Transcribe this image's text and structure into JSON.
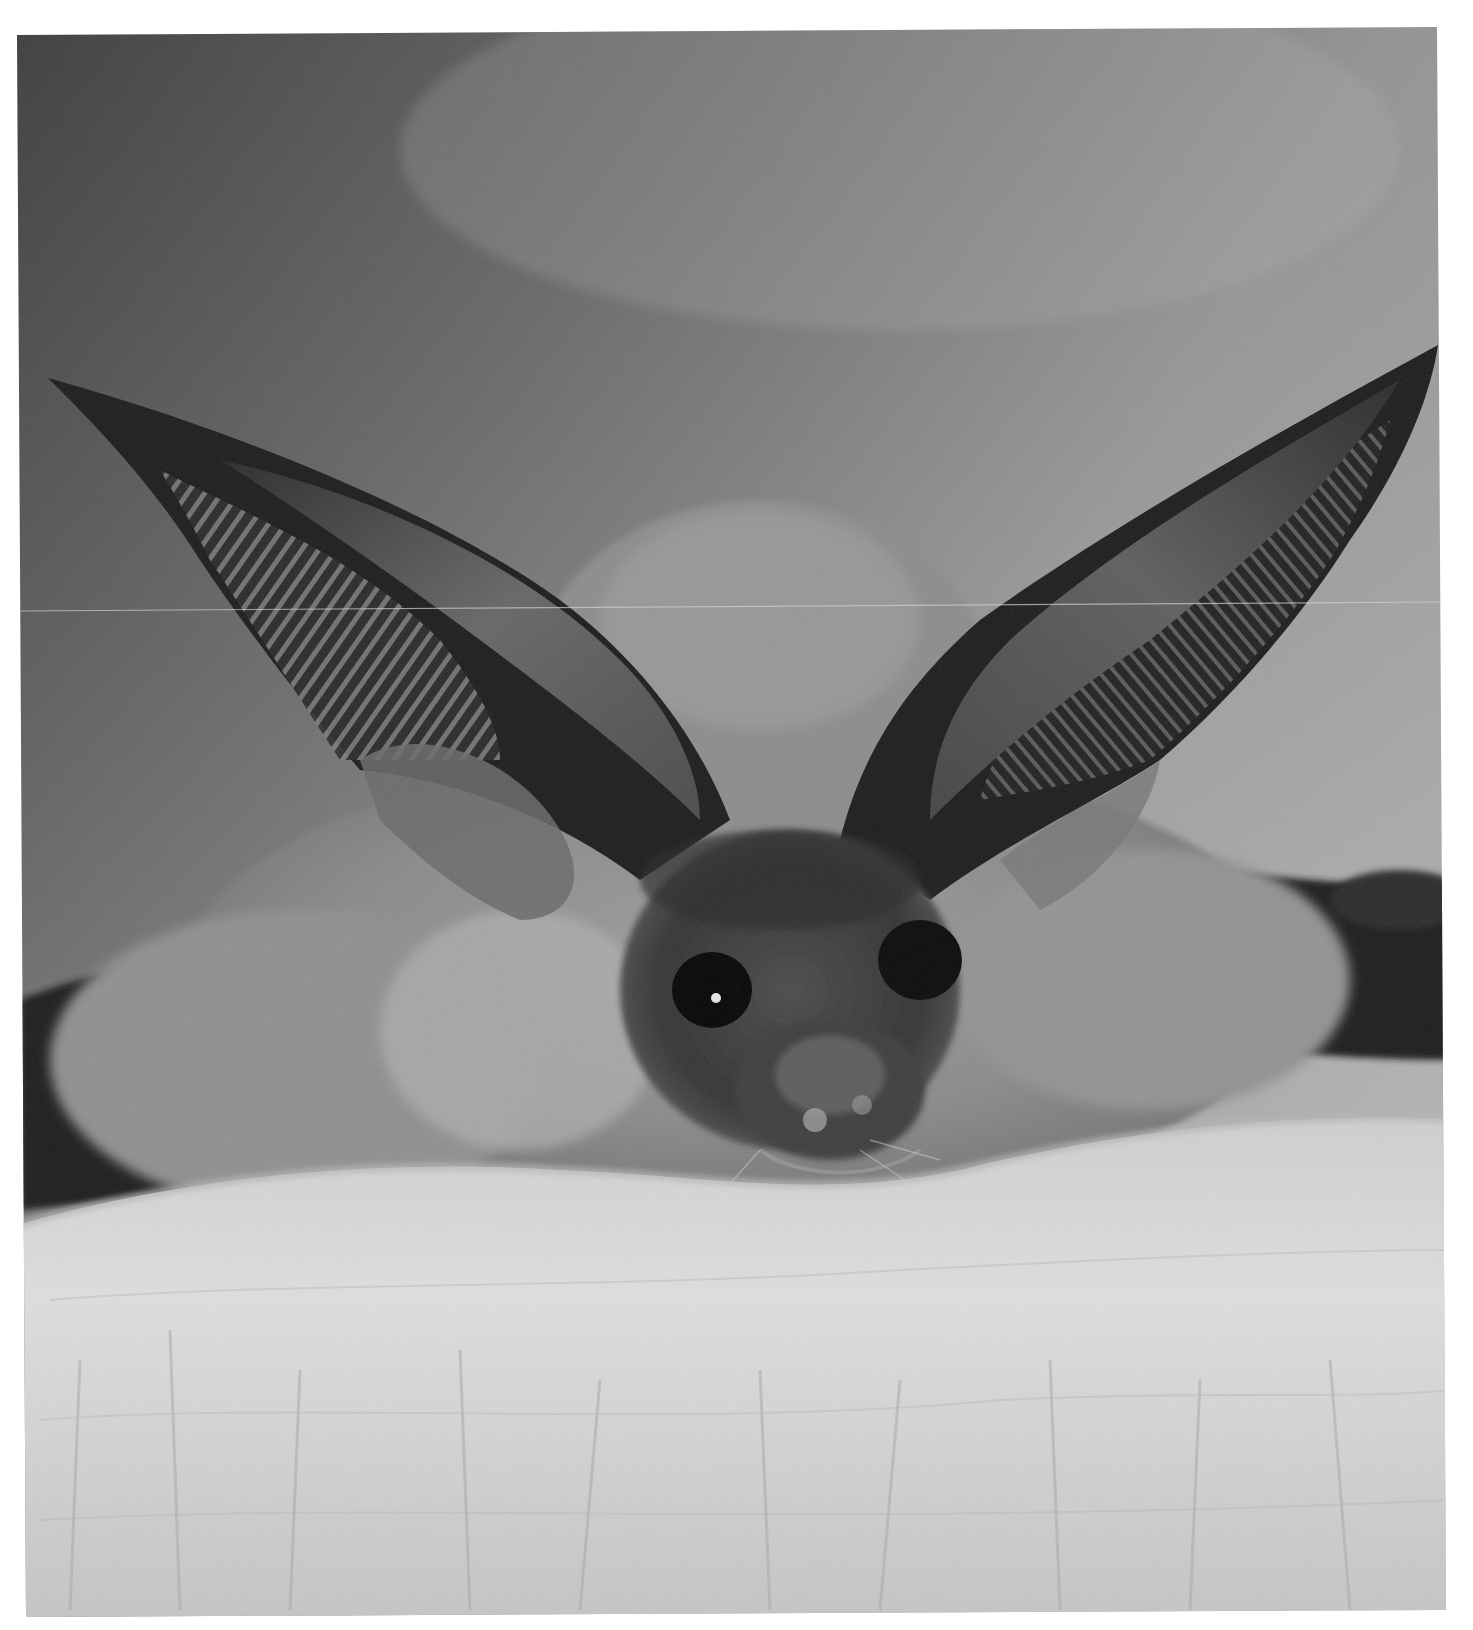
{
  "image": {
    "subject": "long-eared bat resting on a human hand",
    "style": "black-and-white photograph",
    "caption": "Close-up of a long-eared bat with large ribbed ears, resting on a hand",
    "colors": {
      "page_background": "#ffffff",
      "sky_dark": "#4a4a4a",
      "sky_light": "#a8a8a8",
      "fur": "#8a8a8a",
      "ear_dark": "#1e1e1e",
      "ear_inner": "#5a5a5a",
      "hand_light": "#dcdcdc",
      "hand_mid": "#bdbdbd",
      "eye": "#050505"
    }
  }
}
